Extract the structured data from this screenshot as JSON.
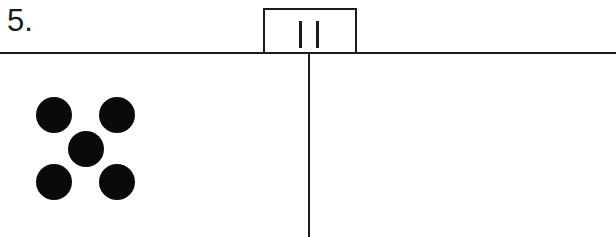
{
  "question": {
    "number_label": "5."
  },
  "answer_box": {
    "tally_count": 2,
    "tally_marks": "||"
  },
  "left_panel": {
    "dot_count": 5,
    "arrangement": "dice-five",
    "dots": [
      {
        "cx": 54,
        "cy": 115
      },
      {
        "cx": 117,
        "cy": 115
      },
      {
        "cx": 86,
        "cy": 149
      },
      {
        "cx": 54,
        "cy": 182
      },
      {
        "cx": 117,
        "cy": 182
      }
    ],
    "dot_color": "#0a0a0a"
  },
  "right_panel": {
    "content": ""
  },
  "colors": {
    "line": "#1a1a1a",
    "background": "#ffffff"
  }
}
